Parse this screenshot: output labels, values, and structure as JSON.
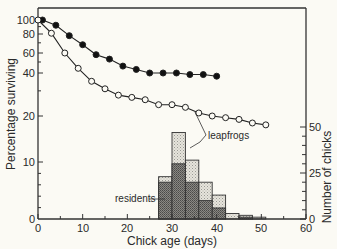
{
  "chart_data": {
    "type": "line",
    "title": "",
    "xlabel": "Chick age (days)",
    "ylabel": "Percentage surviving",
    "y2label": "Number of chicks",
    "xlim": [
      0,
      60
    ],
    "xticks": [
      0,
      10,
      20,
      30,
      40,
      50,
      60
    ],
    "yscale": "log (broken to 0)",
    "yticks": [
      0,
      10,
      20,
      40,
      60,
      80,
      100
    ],
    "y2lim": [
      0,
      50
    ],
    "y2ticks": [
      0,
      25,
      50
    ],
    "grid": false,
    "series": [
      {
        "name": "residents survival",
        "marker": "filled circle",
        "x": [
          1,
          4,
          7,
          10,
          13,
          16,
          19,
          22,
          25,
          28,
          31,
          34,
          37,
          40
        ],
        "y": [
          100,
          92,
          78,
          68,
          58,
          53,
          46,
          43,
          40,
          40,
          40,
          39,
          39,
          38
        ]
      },
      {
        "name": "leapfrogs survival",
        "marker": "open circle",
        "x": [
          0,
          3,
          6,
          9,
          12,
          15,
          18,
          21,
          24,
          27,
          30,
          33,
          36,
          39,
          42,
          45,
          48,
          51
        ],
        "y": [
          100,
          81,
          60,
          44,
          35,
          31,
          28,
          27,
          26,
          24,
          24,
          23,
          21,
          20,
          19.5,
          19,
          18,
          17.5
        ]
      }
    ],
    "histogram": {
      "axis": "right",
      "bin_edges": [
        27,
        30,
        33,
        36,
        39,
        42,
        45,
        48,
        51
      ],
      "series": [
        {
          "name": "residents",
          "fill": "dark stipple",
          "values": [
            20,
            30,
            20,
            10,
            6,
            0,
            1,
            0
          ]
        },
        {
          "name": "leapfrogs (total)",
          "fill": "light stipple",
          "values": [
            23,
            47,
            32,
            20,
            13,
            3,
            2,
            1
          ]
        }
      ]
    },
    "annotations": [
      "leapfrogs",
      "residents"
    ]
  },
  "labels": {
    "xlabel": "Chick age (days)",
    "ylabel": "Percentage surviving",
    "y2label": "Number of chicks",
    "leapfrogs": "leapfrogs",
    "residents": "residents",
    "x0": "0",
    "x10": "10",
    "x20": "20",
    "x30": "30",
    "x40": "40",
    "x50": "50",
    "x60": "60",
    "y0": "0",
    "y10": "10",
    "y20": "20",
    "y40": "40",
    "y60": "60",
    "y80": "80",
    "y100": "100",
    "r0": "0",
    "r25": "25",
    "r50": "50"
  }
}
